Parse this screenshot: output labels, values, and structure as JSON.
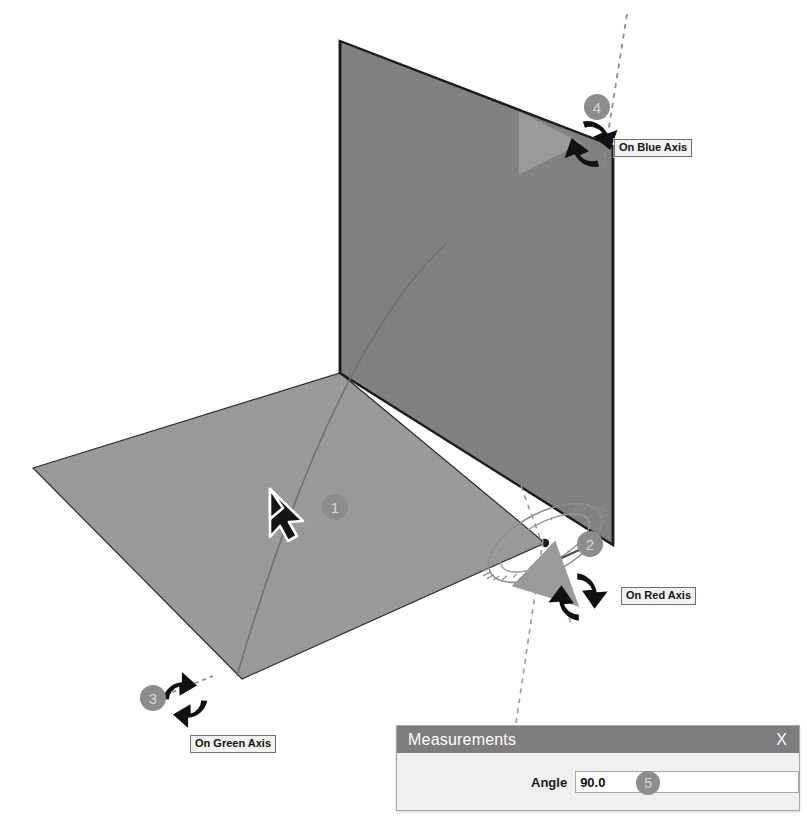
{
  "scene": {
    "description": "SketchUp rotate tool on two perpendicular rectangular faces",
    "colors": {
      "vertical_face": "#818181",
      "horizontal_face": "#9a9a9a",
      "face_outline": "#1c1c1c",
      "badge_fill": "#8c8c8c",
      "badge_text": "#d6d6d6",
      "rotate_arrow": "#111111",
      "pointer_arrow": "#9a9a9a",
      "protractor": "#8e8e8e",
      "inference_dash": "#8e8e8e",
      "dialog_titlebar": "#7d7d7d",
      "dialog_body": "#f0f0ee"
    }
  },
  "callouts": [
    {
      "id": "1",
      "number": "1",
      "name": "rotate-on-face",
      "x": 322,
      "y": 494
    },
    {
      "id": "2",
      "number": "2",
      "name": "rotate-on-red-axis",
      "x": 577,
      "y": 531
    },
    {
      "id": "3",
      "number": "3",
      "name": "rotate-on-green-axis",
      "x": 140,
      "y": 685
    },
    {
      "id": "4",
      "number": "4",
      "name": "rotate-on-blue-axis",
      "x": 584,
      "y": 94
    },
    {
      "id": "5",
      "number": "5",
      "name": "angle-measurement",
      "x": 0,
      "y": 0
    }
  ],
  "axis_labels": [
    {
      "id": "blue",
      "text": "On Blue Axis",
      "x": 614,
      "y": 139
    },
    {
      "id": "red",
      "text": "On Red Axis",
      "x": 621,
      "y": 587
    },
    {
      "id": "green",
      "text": "On Green Axis",
      "x": 190,
      "y": 735
    }
  ],
  "measurements": {
    "title": "Measurements",
    "close_label": "X",
    "angle_label": "Angle",
    "angle_value": "90.0",
    "angle_placeholder": ""
  },
  "cursor": {
    "name": "rotate-cursor",
    "x": 270,
    "y": 489
  }
}
